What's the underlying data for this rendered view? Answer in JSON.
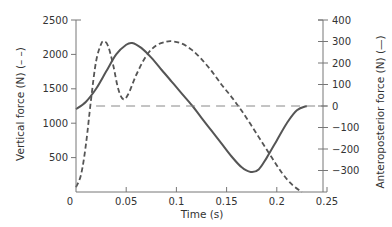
{
  "chart_data": {
    "type": "line",
    "title": "",
    "xlabel": "Time (s)",
    "ylabel_left": "Vertical force (N) (– –)",
    "ylabel_right": "Anteroposterior force (N) (—)",
    "xlim": [
      0,
      0.25
    ],
    "ylim_left": [
      0,
      2500
    ],
    "ylim_right": [
      -375,
      400
    ],
    "xticks": [
      0,
      0.05,
      0.1,
      0.15,
      0.2,
      0.25
    ],
    "xtick_labels": [
      "0",
      "0.05",
      "0.1",
      "0.15",
      "0.2",
      "0.25"
    ],
    "yticks_left": [
      500,
      1000,
      1500,
      2000,
      2500
    ],
    "ytick_labels_left": [
      "500",
      "1000",
      "1500",
      "2000",
      "2500"
    ],
    "yticks_right": [
      -300,
      -200,
      -100,
      0,
      100,
      200,
      300,
      400
    ],
    "ytick_labels_right": [
      "−300",
      "−200",
      "−100",
      "0",
      "100",
      "200",
      "300",
      "400"
    ],
    "grid": false,
    "legend": "none (line styles noted in axis labels)",
    "series": [
      {
        "name": "Vertical force",
        "axis": "left",
        "style": "dashed",
        "x": [
          0,
          0.005,
          0.01,
          0.015,
          0.02,
          0.025,
          0.028,
          0.032,
          0.037,
          0.042,
          0.047,
          0.052,
          0.06,
          0.07,
          0.08,
          0.09,
          0.096,
          0.105,
          0.115,
          0.125,
          0.135,
          0.145,
          0.155,
          0.165,
          0.175,
          0.185,
          0.195,
          0.205,
          0.215,
          0.225
        ],
        "values": [
          70,
          250,
          700,
          1350,
          1900,
          2150,
          2190,
          2120,
          1850,
          1500,
          1350,
          1420,
          1700,
          1980,
          2130,
          2185,
          2190,
          2160,
          2070,
          1930,
          1760,
          1560,
          1380,
          1180,
          960,
          730,
          500,
          280,
          110,
          0
        ]
      },
      {
        "name": "Anteroposterior force",
        "axis": "right",
        "style": "solid",
        "x": [
          0,
          0.01,
          0.02,
          0.03,
          0.04,
          0.05,
          0.056,
          0.065,
          0.075,
          0.085,
          0.095,
          0.105,
          0.116,
          0.125,
          0.135,
          0.145,
          0.155,
          0.165,
          0.174,
          0.182,
          0.19,
          0.2,
          0.21,
          0.22,
          0.23
        ],
        "values": [
          -15,
          20,
          80,
          160,
          240,
          285,
          293,
          270,
          225,
          170,
          115,
          60,
          0,
          -55,
          -115,
          -175,
          -235,
          -285,
          -307,
          -295,
          -240,
          -160,
          -80,
          -20,
          0
        ]
      },
      {
        "name": "Zero / body-weight reference",
        "axis": "right",
        "style": "long-dashed",
        "x": [
          0.02,
          0.25
        ],
        "values": [
          0,
          0
        ]
      }
    ]
  },
  "colors": {
    "axis": "#777777",
    "line": "#555555",
    "text": "#333333"
  }
}
